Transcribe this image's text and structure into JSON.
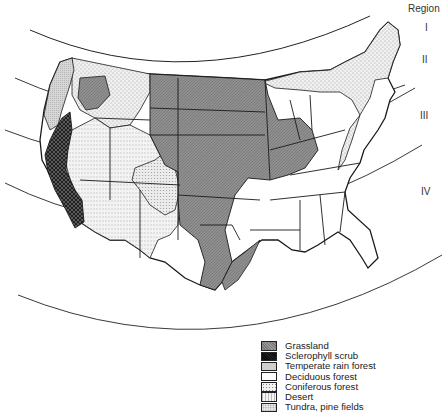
{
  "map": {
    "title": "",
    "region_header": "Region",
    "regions": [
      "I",
      "II",
      "III",
      "IV"
    ],
    "legend": [
      {
        "key": "grassland",
        "label": "Grassland"
      },
      {
        "key": "sclerophyll",
        "label": "Sclerophyll scrub"
      },
      {
        "key": "rainforest",
        "label": "Temperate rain forest"
      },
      {
        "key": "deciduous",
        "label": "Deciduous forest"
      },
      {
        "key": "coniferous",
        "label": "Coniferous forest"
      },
      {
        "key": "desert",
        "label": "Desert"
      },
      {
        "key": "tundra",
        "label": "Tundra, pine fields"
      }
    ],
    "colors": {
      "grassland": "#8a8a8a",
      "sclerophyll": "#3a3a3a",
      "rainforest": "#d2d2d2",
      "deciduous": "#ffffff",
      "coniferous": "#e6e6e6",
      "desert": "#ececec",
      "tundra": "#e2e2e2",
      "outline": "#1a1a1a"
    }
  }
}
